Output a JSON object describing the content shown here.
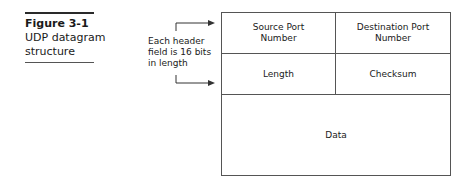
{
  "caption": {
    "figure_label": "Figure 3-1",
    "title_line1": "UDP datagram",
    "title_line2": "structure"
  },
  "annotation": {
    "line1": "Each header",
    "line2": "field is 16 bits",
    "line3": "in length"
  },
  "datagram": {
    "row1": {
      "left_line1": "Source Port",
      "left_line2": "Number",
      "right_line1": "Destination Port",
      "right_line2": "Number"
    },
    "row2": {
      "left": "Length",
      "right": "Checksum"
    },
    "data": "Data"
  }
}
